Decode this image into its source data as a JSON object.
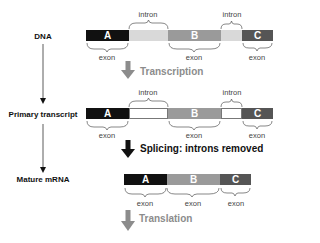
{
  "stages": [
    {
      "label": "DNA"
    },
    {
      "label": "Primary transcript"
    },
    {
      "label": "Mature mRNA"
    }
  ],
  "steps": [
    {
      "label": "Transcription",
      "color": "#8c8c8c"
    },
    {
      "label": "Splicing: introns removed",
      "color": "#111111"
    },
    {
      "label": "Translation",
      "color": "#8c8c8c"
    }
  ],
  "dna": {
    "segments": [
      {
        "type": "exon",
        "label": "A",
        "color": "#111111"
      },
      {
        "type": "intron",
        "label": "",
        "color": "#d9d9d9"
      },
      {
        "type": "exon",
        "label": "B",
        "color": "#9a9a9a"
      },
      {
        "type": "intron",
        "label": "",
        "color": "#d9d9d9"
      },
      {
        "type": "exon",
        "label": "C",
        "color": "#555555"
      }
    ],
    "intron_labels": [
      "intron",
      "intron"
    ],
    "exon_labels": [
      "exon",
      "exon",
      "exon"
    ]
  },
  "primary_transcript": {
    "segments": [
      {
        "type": "exon",
        "label": "A",
        "color": "#111111"
      },
      {
        "type": "intron",
        "label": "",
        "color": "#ffffff"
      },
      {
        "type": "exon",
        "label": "B",
        "color": "#9a9a9a"
      },
      {
        "type": "intron",
        "label": "",
        "color": "#ffffff"
      },
      {
        "type": "exon",
        "label": "C",
        "color": "#555555"
      }
    ],
    "intron_labels": [
      "intron",
      "intron"
    ],
    "exon_labels": [
      "exon",
      "exon",
      "exon"
    ]
  },
  "mature_mrna": {
    "segments": [
      {
        "type": "exon",
        "label": "A",
        "color": "#111111"
      },
      {
        "type": "exon",
        "label": "B",
        "color": "#9a9a9a"
      },
      {
        "type": "exon",
        "label": "C",
        "color": "#555555"
      }
    ],
    "exon_labels": [
      "exon",
      "exon",
      "exon"
    ]
  }
}
